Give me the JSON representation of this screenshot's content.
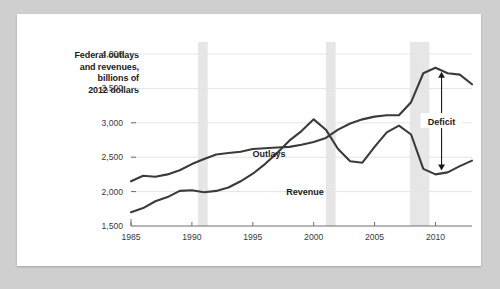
{
  "chart_data": {
    "type": "line",
    "title": "Federal outlays and revenues, billions of 2012 dollars",
    "title_lines": [
      "Federal outlays",
      "and revenues,",
      "billions of",
      "2012 dollars"
    ],
    "xlabel": "",
    "ylabel": "",
    "xlim": [
      1985,
      2013
    ],
    "ylim": [
      1500,
      4000
    ],
    "ytick_labels": [
      "4,000",
      "3,500",
      "3,000",
      "2,500",
      "2,000",
      "1,500"
    ],
    "ytick_values": [
      4000,
      3500,
      3000,
      2500,
      2000,
      1500
    ],
    "xtick_labels": [
      "1985",
      "1990",
      "1995",
      "2000",
      "2005",
      "2010"
    ],
    "xtick_values": [
      1985,
      1990,
      1995,
      2000,
      2005,
      2010
    ],
    "grid": true,
    "legend_position": "inline-labels",
    "line_color": "#3b3b3b",
    "grid_color": "#e4e4e4",
    "axis_color": "#6e6e6e",
    "recession_band_color": "#e6e6e6",
    "x": [
      1985,
      1986,
      1987,
      1988,
      1989,
      1990,
      1991,
      1992,
      1993,
      1994,
      1995,
      1996,
      1997,
      1998,
      1999,
      2000,
      2001,
      2002,
      2003,
      2004,
      2005,
      2006,
      2007,
      2008,
      2009,
      2010,
      2011,
      2012,
      2013
    ],
    "series": [
      {
        "name": "Outlays",
        "label": "Outlays",
        "values": [
          2150,
          2230,
          2215,
          2250,
          2310,
          2400,
          2475,
          2540,
          2560,
          2580,
          2620,
          2630,
          2640,
          2650,
          2680,
          2720,
          2780,
          2900,
          2990,
          3050,
          3090,
          3110,
          3110,
          3300,
          3720,
          3800,
          3720,
          3700,
          3560
        ]
      },
      {
        "name": "Revenue",
        "label": "Revenue",
        "values": [
          1700,
          1760,
          1860,
          1920,
          2010,
          2020,
          1990,
          2010,
          2060,
          2150,
          2260,
          2400,
          2560,
          2740,
          2880,
          3050,
          2900,
          2620,
          2440,
          2420,
          2650,
          2860,
          2960,
          2830,
          2330,
          2250,
          2280,
          2370,
          2450
        ]
      }
    ],
    "recession_bands": [
      {
        "start": 1990.5,
        "end": 1991.3
      },
      {
        "start": 2001.0,
        "end": 2001.8
      },
      {
        "start": 2007.9,
        "end": 2009.5
      }
    ],
    "annotations": [
      {
        "name": "deficit",
        "label": "Deficit",
        "type": "double-arrow",
        "x": 2010.5,
        "y_top": 3800,
        "y_bottom": 2250
      }
    ]
  }
}
